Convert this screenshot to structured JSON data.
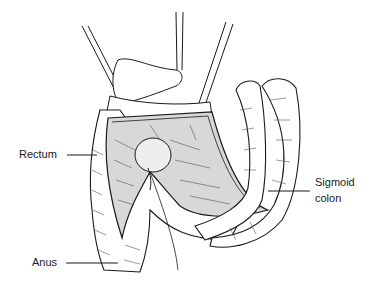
{
  "figure": {
    "type": "surgical line illustration",
    "labels": {
      "rectum": "Rectum",
      "anus": "Anus",
      "sigmoid_line1": "Sigmoid",
      "sigmoid_line2": "colon"
    },
    "colors": {
      "ink": "#1a1a1a",
      "background": "#ffffff",
      "shading": "#555555"
    }
  }
}
